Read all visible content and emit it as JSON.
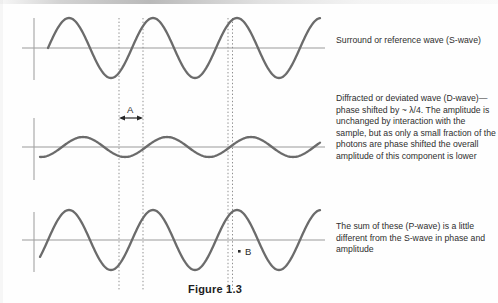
{
  "figure": {
    "caption": "Figure 1.3",
    "labels": {
      "a": "A",
      "b": "B"
    },
    "notes": [
      "Surround or reference wave (S-wave)",
      "Diffracted or deviated wave (D-wave)—phase shifted by ~ λ/4. The amplitude is unchanged by interaction with the sample, but as only a small fraction of the photons are phase shifted the overall amplitude of this component is lower",
      "The sum of these (P-wave) is a little different from the S-wave in phase and amplitude"
    ]
  },
  "chart_data": {
    "type": "line",
    "title": "Figure 1.3",
    "xlabel": "",
    "ylabel": "",
    "grid": false,
    "legend_position": "right",
    "axis_ranges": {
      "x": [
        34,
        325
      ],
      "y_amplitude_units": [
        -1,
        1
      ]
    },
    "annotations": [
      {
        "text": "A",
        "meaning": "phase shift interval between guide lines",
        "x": 131,
        "y": 108
      },
      {
        "text": "B",
        "meaning": "marker on P-wave zero crossing",
        "x": 245,
        "y": 250
      }
    ],
    "guide_lines": [
      {
        "x": 119,
        "style": "dotted"
      },
      {
        "x": 143,
        "style": "dotted"
      },
      {
        "x": 228,
        "style": "dotted"
      },
      {
        "x": 232,
        "style": "dotted"
      }
    ],
    "series": [
      {
        "name": "Surround or reference wave (S-wave)",
        "baseline_y": 48,
        "amplitude_px": 30,
        "wavelength_px": 84,
        "phase_offset_px": 0,
        "start_x": 48,
        "end_x": 320,
        "color": "#6b6b6b"
      },
      {
        "name": "Diffracted or deviated wave (D-wave)",
        "baseline_y": 147,
        "amplitude_px": 10,
        "wavelength_px": 84,
        "phase_offset_px": -22,
        "start_x": 40,
        "end_x": 320,
        "color": "#6b6b6b"
      },
      {
        "name": "Sum of these (P-wave)",
        "baseline_y": 240,
        "amplitude_px": 30,
        "wavelength_px": 84,
        "phase_offset_px": -8,
        "start_x": 40,
        "end_x": 320,
        "color": "#6b6b6b"
      }
    ]
  }
}
